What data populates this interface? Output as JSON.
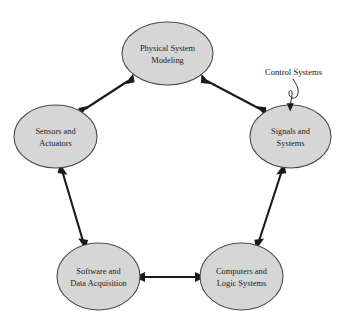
{
  "diagram": {
    "background_color": "#ffffff",
    "node_fill_color": "#d6d6d6",
    "node_stroke_color": "#4a4a4a",
    "edge_color": "#1a1a1a",
    "text_color": "#1b1b1b"
  },
  "nodes": [
    {
      "id": "physical-system-modeling",
      "line1": "Physical System",
      "line2": "Modeling",
      "cx": 167.5,
      "cy": 53.5,
      "rx": 45.5,
      "ry": 31.5
    },
    {
      "id": "sensors-and-actuators",
      "line1": "Sensors and",
      "line2": "Actuators",
      "cx": 55.5,
      "cy": 136.5,
      "rx": 41.5,
      "ry": 31.5
    },
    {
      "id": "signals-and-systems",
      "line1": "Signals and",
      "line2": "Systems",
      "cx": 290.5,
      "cy": 136.5,
      "rx": 40.5,
      "ry": 31.5
    },
    {
      "id": "software-and-data-acquisition",
      "line1": "Software and",
      "line2": "Data Acquisition",
      "cx": 98.5,
      "cy": 276.5,
      "rx": 41.5,
      "ry": 33.5
    },
    {
      "id": "computers-and-logic-systems",
      "line1": "Computers and",
      "line2": "Logic Systems",
      "cx": 241.5,
      "cy": 276.5,
      "rx": 41.5,
      "ry": 33.5
    }
  ],
  "edges": [
    {
      "id": "edge-modeling-sensors",
      "from": "physical-system-modeling",
      "to": "sensors-and-actuators",
      "arrows": "both",
      "x1": 130.0,
      "y1": 79.0,
      "x2": 83.0,
      "y2": 110.0
    },
    {
      "id": "edge-modeling-signals",
      "from": "physical-system-modeling",
      "to": "signals-and-systems",
      "arrows": "both",
      "x1": 205.0,
      "y1": 79.0,
      "x2": 262.0,
      "y2": 110.0
    },
    {
      "id": "edge-sensors-software",
      "from": "sensors-and-actuators",
      "to": "software-and-data-acquisition",
      "arrows": "both",
      "x1": 62.0,
      "y1": 168.0,
      "x2": 84.0,
      "y2": 244.0
    },
    {
      "id": "edge-signals-computers",
      "from": "signals-and-systems",
      "to": "computers-and-logic-systems",
      "arrows": "both",
      "x1": 282.0,
      "y1": 168.0,
      "x2": 257.0,
      "y2": 244.0
    },
    {
      "id": "edge-software-computers",
      "from": "software-and-data-acquisition",
      "to": "computers-and-logic-systems",
      "arrows": "both",
      "x1": 141.0,
      "y1": 277.0,
      "x2": 199.0,
      "y2": 277.0
    }
  ],
  "annotation": {
    "id": "control-systems-annotation",
    "label": "Control Systems",
    "label_x": 265.0,
    "label_y": 75.0,
    "target_node": "signals-and-systems",
    "leader_path": "M 292 80 C 296 86, 299 92, 296 97 C 293 101, 288 99, 288 94 C 288 91, 290 90, 291 92 C 292 94, 291 99, 290 103",
    "arrow_tip_x": 290.0,
    "arrow_tip_y": 110.0
  }
}
